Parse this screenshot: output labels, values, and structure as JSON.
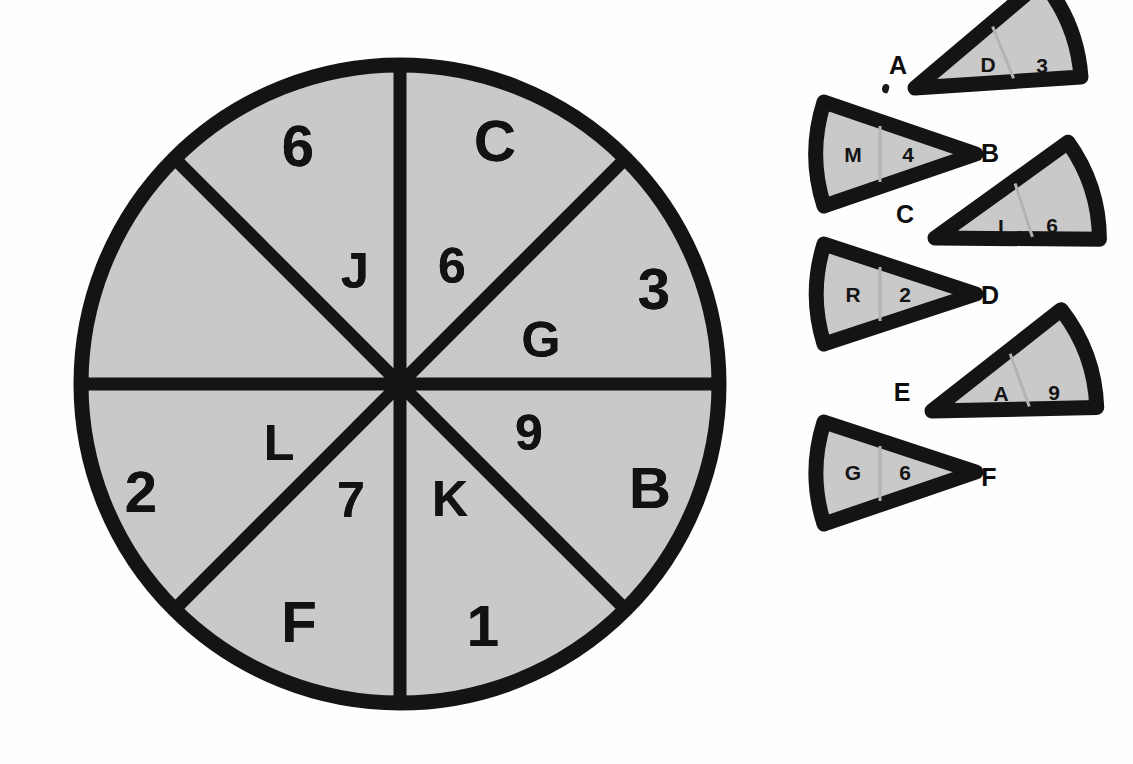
{
  "figure": {
    "colors": {
      "sector_fill": "#c9c9c9",
      "outline": "#141414",
      "background": "#fefefe",
      "text": "#121212"
    }
  },
  "wheel": {
    "center": {
      "x": 340,
      "y": 340
    },
    "radius": 327,
    "sector_count": 8,
    "sector_span_degrees": 45,
    "sectors": [
      {
        "id": "sector-1",
        "start_deg": 0,
        "end_deg": 45,
        "inner_label": "G",
        "outer_label": "3"
      },
      {
        "id": "sector-2",
        "start_deg": 45,
        "end_deg": 90,
        "inner_label": "6",
        "outer_label": "C"
      },
      {
        "id": "sector-3",
        "start_deg": 90,
        "end_deg": 135,
        "inner_label": "J",
        "outer_label": "6"
      },
      {
        "id": "sector-4",
        "start_deg": 135,
        "end_deg": 180,
        "inner_label": "",
        "outer_label": ""
      },
      {
        "id": "sector-5",
        "start_deg": 180,
        "end_deg": 225,
        "inner_label": "L",
        "outer_label": "2"
      },
      {
        "id": "sector-6",
        "start_deg": 225,
        "end_deg": 270,
        "inner_label": "7",
        "outer_label": "F"
      },
      {
        "id": "sector-7",
        "start_deg": 270,
        "end_deg": 315,
        "inner_label": "K",
        "outer_label": "1"
      },
      {
        "id": "sector-8",
        "start_deg": 315,
        "end_deg": 360,
        "inner_label": "9",
        "outer_label": "B"
      }
    ]
  },
  "pieces": [
    {
      "id": "piece-d3",
      "external_label": "A",
      "external_label_side": "left",
      "inner_label": "D",
      "outer_label": "3",
      "rotation_deg": -22
    },
    {
      "id": "piece-m4",
      "external_label": "B",
      "external_label_side": "right",
      "inner_label": "M",
      "outer_label": "4",
      "rotation_deg": 0
    },
    {
      "id": "piece-i6",
      "external_label": "C",
      "external_label_side": "left",
      "inner_label": "I",
      "outer_label": "6",
      "rotation_deg": -18
    },
    {
      "id": "piece-r2",
      "external_label": "D",
      "external_label_side": "right",
      "inner_label": "R",
      "outer_label": "2",
      "rotation_deg": 0
    },
    {
      "id": "piece-a9",
      "external_label": "E",
      "external_label_side": "left",
      "inner_label": "A",
      "outer_label": "9",
      "rotation_deg": -20
    },
    {
      "id": "piece-g6",
      "external_label": "F",
      "external_label_side": "right",
      "inner_label": "G",
      "outer_label": "6",
      "rotation_deg": 0
    }
  ],
  "marks": [
    {
      "id": "speck-under-a",
      "kind": "ink-speck"
    }
  ]
}
